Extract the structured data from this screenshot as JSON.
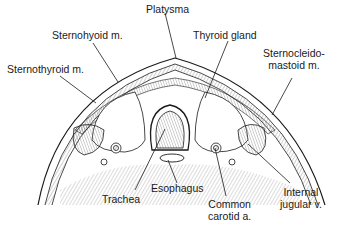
{
  "diagram": {
    "labels": {
      "platysma": "Platysma",
      "sternohyoid": "Sternohyoid m.",
      "thyroid_gland": "Thyroid gland",
      "sternothyroid": "Sternothyroid m.",
      "sternocleidomastoid_line1": "Sternocleido-",
      "sternocleidomastoid_line2": "mastoid m.",
      "trachea": "Trachea",
      "esophagus": "Esophagus",
      "common_carotid_line1": "Common",
      "common_carotid_line2": "carotid a.",
      "internal_jugular_line1": "Internal",
      "internal_jugular_line2": "jugular v."
    },
    "colors": {
      "ink": "#1a1a1a",
      "background": "#ffffff",
      "hatch": "#555555"
    }
  }
}
